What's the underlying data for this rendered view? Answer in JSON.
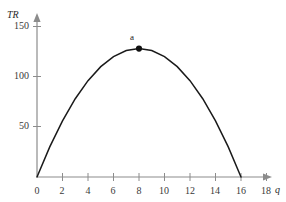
{
  "chart_data": {
    "type": "line",
    "title": "",
    "subtitle": "",
    "xlabel": "q",
    "ylabel": "TR",
    "xlim": [
      0,
      19.2
    ],
    "ylim": [
      0,
      163
    ],
    "grid": false,
    "legend": null,
    "curve_description": "Total revenue parabola rising from origin to a maximum at q = 8 and falling back to zero at q = 16",
    "equation": "TR = 16q - q^2",
    "x": [
      0,
      1,
      2,
      3,
      4,
      5,
      6,
      7,
      8,
      9,
      10,
      11,
      12,
      13,
      14,
      15,
      16
    ],
    "values": [
      0,
      30,
      56,
      78,
      96,
      110,
      120,
      126,
      128,
      126,
      120,
      110,
      96,
      78,
      56,
      30,
      0
    ],
    "x_ticks": [
      0,
      2,
      4,
      6,
      8,
      10,
      12,
      14,
      16,
      18
    ],
    "x_tick_labels": [
      "0",
      "2",
      "4",
      "6",
      "8",
      "10",
      "12",
      "14",
      "16",
      "18"
    ],
    "y_ticks": [
      50,
      100,
      150
    ],
    "y_tick_labels": [
      "50",
      "100",
      "150"
    ],
    "annotations": [
      {
        "label": "a",
        "x": 8,
        "y": 128,
        "marker": "filled-circle",
        "note": "maximum total revenue point"
      }
    ],
    "colors": {
      "curve": "#1a1a1a",
      "axis": "#8c8c8c",
      "marker": "#111111",
      "tick_text": "#3a3a3a",
      "background": "#ffffff"
    }
  },
  "axes": {
    "y_axis_name": "TR",
    "x_axis_name": "q"
  }
}
